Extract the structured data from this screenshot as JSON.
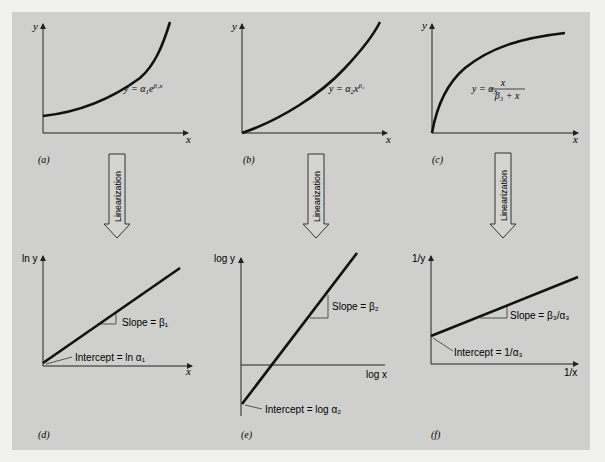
{
  "figure": {
    "background": "#cfcfcd",
    "page_background": "#f1f1ef",
    "line_color": "#1a1a1a",
    "arrow_label": "Linearization",
    "panels": [
      {
        "id": "a",
        "label": "(a)",
        "y_axis": "y",
        "x_axis": "x",
        "equation": "y = α₁e^(β₁x)",
        "eq_main": "y = α",
        "eq_sub": "1",
        "eq_e": "e",
        "eq_sup": "β₁x",
        "curve": "exponential"
      },
      {
        "id": "b",
        "label": "(b)",
        "y_axis": "y",
        "x_axis": "x",
        "equation": "y = α₂x^β₂",
        "eq_main": "y = α",
        "eq_sub": "2",
        "eq_x": "x",
        "eq_sup": "β₂",
        "curve": "power"
      },
      {
        "id": "c",
        "label": "(c)",
        "y_axis": "y",
        "x_axis": "x",
        "equation": "y = α₃ x/(β₃ + x)",
        "eq_main": "y = α",
        "eq_sub": "3",
        "eq_num": "x",
        "eq_den": "β₃ + x",
        "curve": "saturation-growth"
      },
      {
        "id": "d",
        "label": "(d)",
        "y_axis": "ln y",
        "x_axis": "x",
        "slope": "Slope = β₁",
        "intercept": "Intercept = ln α₁",
        "line": "positive slope through intercept above origin"
      },
      {
        "id": "e",
        "label": "(e)",
        "y_axis": "log y",
        "x_axis": "log x",
        "slope": "Slope = β₂",
        "intercept": "Intercept = log α₂",
        "line": "steep positive slope, negative intercept"
      },
      {
        "id": "f",
        "label": "(f)",
        "y_axis": "1/y",
        "x_axis": "1/x",
        "slope": "Slope = β₃/α₃",
        "intercept": "Intercept = 1/α₃",
        "line": "shallow positive slope, positive intercept"
      }
    ]
  }
}
